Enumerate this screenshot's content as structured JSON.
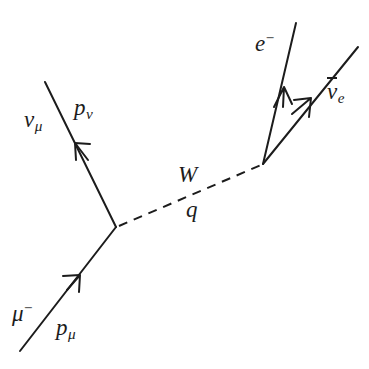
{
  "diagram": {
    "background_color": "#ffffff",
    "line_color": "#1c1c1c",
    "width": 369,
    "height": 369,
    "labels": {
      "incoming_muon": "μ",
      "incoming_muon_charge": "−",
      "incoming_muon_momentum": "p",
      "incoming_muon_momentum_sub": "μ",
      "outgoing_muon_neutrino": "ν",
      "outgoing_muon_neutrino_sub": "μ",
      "outgoing_muon_neutrino_momentum": "p",
      "outgoing_muon_neutrino_momentum_sub": "ν",
      "boson": "W",
      "boson_momentum": "q",
      "outgoing_electron": "e",
      "outgoing_electron_charge": "−",
      "outgoing_antineutrino": "ν",
      "outgoing_antineutrino_sub": "e"
    },
    "vertices": {
      "left_vertex": {
        "x": 116,
        "y": 227
      },
      "right_vertex": {
        "x": 263,
        "y": 164
      }
    },
    "lines": [
      {
        "name": "muon-in",
        "from": {
          "x": 20,
          "y": 351
        },
        "to": {
          "x": 116,
          "y": 227
        },
        "style": "solid"
      },
      {
        "name": "neutrino-out",
        "from": {
          "x": 116,
          "y": 227
        },
        "to": {
          "x": 45,
          "y": 82
        },
        "style": "solid"
      },
      {
        "name": "w-boson",
        "from": {
          "x": 116,
          "y": 227
        },
        "to": {
          "x": 263,
          "y": 164
        },
        "style": "dashed"
      },
      {
        "name": "electron-out",
        "from": {
          "x": 263,
          "y": 164
        },
        "to": {
          "x": 296,
          "y": 23
        },
        "style": "solid"
      },
      {
        "name": "antineutrino-out",
        "from": {
          "x": 263,
          "y": 164
        },
        "to": {
          "x": 358,
          "y": 47
        },
        "style": "solid"
      }
    ],
    "arrows": [
      {
        "name": "muon-in-arrow",
        "x": 78,
        "y": 277,
        "direction": "up-right"
      },
      {
        "name": "neutrino-out-arrow",
        "x": 78,
        "y": 147,
        "direction": "up-left"
      },
      {
        "name": "electron-out-arrow",
        "x": 283,
        "y": 89,
        "direction": "up-right-steep"
      },
      {
        "name": "antineutrino-out-arrow",
        "x": 309,
        "y": 101,
        "direction": "up-right-shallow"
      }
    ]
  }
}
